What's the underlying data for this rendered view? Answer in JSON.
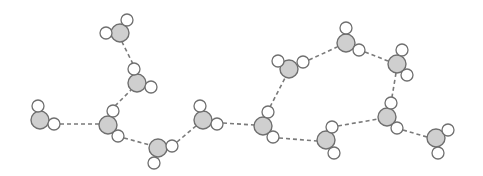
{
  "diagram": {
    "colors": {
      "oxygen_fill": "#cfcfcf",
      "hydrogen_fill": "#ffffff",
      "outline": "#6f6f6f",
      "bond_dash": "#7a7a7a"
    },
    "oxygen_radius": 9,
    "hydrogen_radius": 6,
    "molecules": [
      {
        "id": "m1",
        "o": [
          40,
          120
        ],
        "h": [
          [
            38,
            106
          ],
          [
            54,
            124
          ]
        ]
      },
      {
        "id": "m2",
        "o": [
          108,
          125
        ],
        "h": [
          [
            113,
            111
          ],
          [
            118,
            136
          ]
        ]
      },
      {
        "id": "m3",
        "o": [
          137,
          83
        ],
        "h": [
          [
            134,
            69
          ],
          [
            151,
            87
          ]
        ]
      },
      {
        "id": "m4",
        "o": [
          120,
          33
        ],
        "h": [
          [
            106,
            33
          ],
          [
            127,
            20
          ]
        ]
      },
      {
        "id": "m5",
        "o": [
          158,
          148
        ],
        "h": [
          [
            172,
            146
          ],
          [
            154,
            163
          ]
        ]
      },
      {
        "id": "m6",
        "o": [
          203,
          120
        ],
        "h": [
          [
            200,
            106
          ],
          [
            217,
            124
          ]
        ]
      },
      {
        "id": "m7",
        "o": [
          263,
          126
        ],
        "h": [
          [
            268,
            112
          ],
          [
            273,
            137
          ]
        ]
      },
      {
        "id": "m8",
        "o": [
          289,
          69
        ],
        "h": [
          [
            278,
            61
          ],
          [
            303,
            62
          ]
        ]
      },
      {
        "id": "m9",
        "o": [
          346,
          43
        ],
        "h": [
          [
            346,
            28
          ],
          [
            359,
            50
          ]
        ]
      },
      {
        "id": "m10",
        "o": [
          397,
          64
        ],
        "h": [
          [
            402,
            50
          ],
          [
            407,
            75
          ]
        ]
      },
      {
        "id": "m11",
        "o": [
          387,
          117
        ],
        "h": [
          [
            391,
            103
          ],
          [
            397,
            128
          ]
        ]
      },
      {
        "id": "m12",
        "o": [
          326,
          140
        ],
        "h": [
          [
            332,
            127
          ],
          [
            334,
            153
          ]
        ]
      },
      {
        "id": "m13",
        "o": [
          436,
          138
        ],
        "h": [
          [
            448,
            130
          ],
          [
            438,
            153
          ]
        ]
      }
    ],
    "hydrogen_bonds": [
      {
        "from": [
          60,
          124
        ],
        "to": [
          99,
          124
        ]
      },
      {
        "from": [
          115,
          106
        ],
        "to": [
          131,
          90
        ]
      },
      {
        "from": [
          133,
          64
        ],
        "to": [
          122,
          42
        ]
      },
      {
        "from": [
          124,
          138
        ],
        "to": [
          150,
          145
        ]
      },
      {
        "from": [
          177,
          142
        ],
        "to": [
          196,
          126
        ]
      },
      {
        "from": [
          223,
          123
        ],
        "to": [
          254,
          125
        ]
      },
      {
        "from": [
          270,
          107
        ],
        "to": [
          285,
          78
        ]
      },
      {
        "from": [
          279,
          138
        ],
        "to": [
          317,
          141
        ]
      },
      {
        "from": [
          309,
          60
        ],
        "to": [
          337,
          47
        ]
      },
      {
        "from": [
          365,
          52
        ],
        "to": [
          388,
          61
        ]
      },
      {
        "from": [
          396,
          73
        ],
        "to": [
          392,
          97
        ]
      },
      {
        "from": [
          338,
          126
        ],
        "to": [
          378,
          119
        ]
      },
      {
        "from": [
          403,
          130
        ],
        "to": [
          427,
          137
        ]
      }
    ]
  }
}
